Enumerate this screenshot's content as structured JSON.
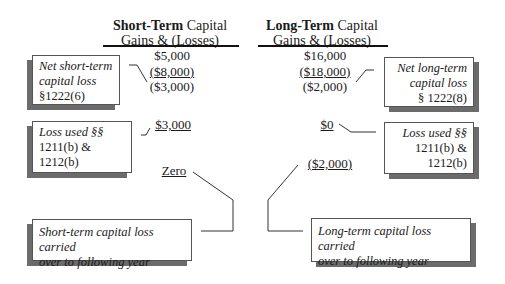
{
  "short_term": {
    "header_bold": "Short-Term",
    "header_rest": " Capital",
    "header_line2": "Gains & (Losses)",
    "gains": "$5,000",
    "losses": "($8,000)",
    "net": "($3,000)",
    "used": "$3,000",
    "carryover": "Zero",
    "box_net": {
      "line1": "Net short-term",
      "line2": "capital loss",
      "line3": "§1222(6)"
    },
    "box_used": {
      "line1": "Loss used §§",
      "line2": "1211(b) &",
      "line3": "1212(b)"
    },
    "box_carry": {
      "line1": "Short-term capital loss carried",
      "line2": "over to following year"
    }
  },
  "long_term": {
    "header_bold": "Long-Term",
    "header_rest": " Capital",
    "header_line2": "Gains & (Losses)",
    "gains": "$16,000",
    "losses": "($18,000)",
    "net": "($2,000)",
    "used": "$0",
    "carryover": "($2,000)",
    "box_net": {
      "line1": "Net long-term",
      "line2": "capital loss",
      "line3": "§ 1222(8)"
    },
    "box_used": {
      "line1": "Loss used §§",
      "line2": "1211(b) &",
      "line3": "1212(b)"
    },
    "box_carry": {
      "line1": "Long-term capital loss carried",
      "line2": "over to following year"
    }
  }
}
